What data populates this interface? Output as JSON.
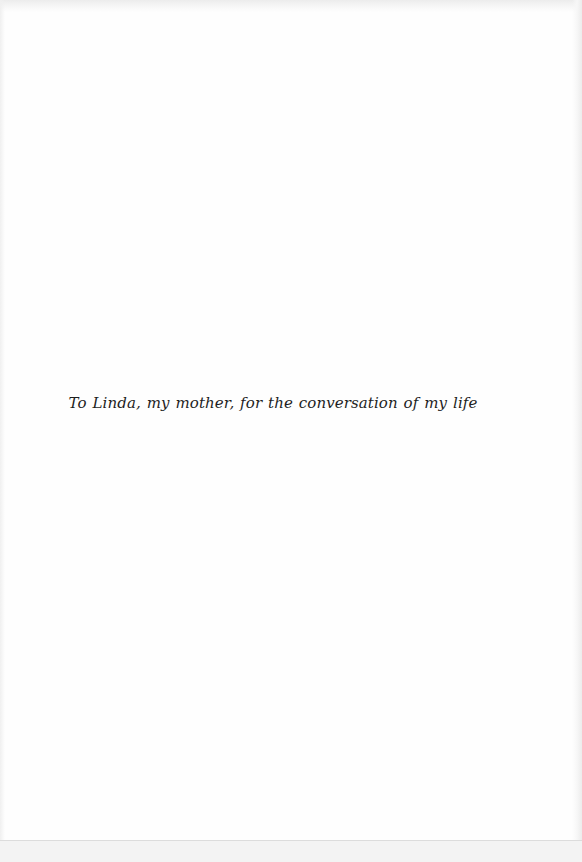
{
  "page": {
    "type": "dedication",
    "dedication_text": "To Linda, my mother, for the conversation of my life"
  },
  "colors": {
    "background": "#fefefe",
    "text": "#1e1e1e",
    "scan_edge": "#ececec"
  }
}
